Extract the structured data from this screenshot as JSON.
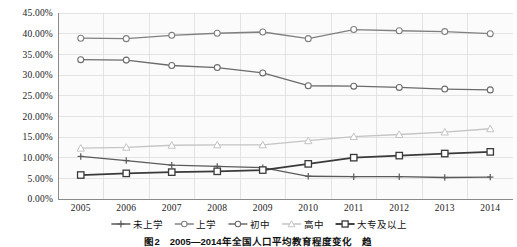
{
  "chart_data": {
    "type": "line",
    "title": "",
    "xlabel": "",
    "ylabel": "",
    "ylim": [
      0,
      45
    ],
    "ytick_values": [
      0,
      5,
      10,
      15,
      20,
      25,
      30,
      35,
      40,
      45
    ],
    "ytick_labels": [
      "0.00%",
      "5.00%",
      "10.00%",
      "15.00%",
      "20.00%",
      "25.00%",
      "30.00%",
      "35.00%",
      "40.00%",
      "45.00%"
    ],
    "grid": true,
    "legend_position": "bottom",
    "categories": [
      "2005",
      "2006",
      "2007",
      "2008",
      "2009",
      "2010",
      "2011",
      "2012",
      "2013",
      "2014"
    ],
    "series": [
      {
        "name": "未上学",
        "marker": "plus",
        "color": "#5a5a5a",
        "values": [
          10.3,
          9.3,
          8.2,
          7.9,
          7.6,
          5.5,
          5.4,
          5.4,
          5.2,
          5.3
        ]
      },
      {
        "name": "上学",
        "marker": "circle",
        "color": "#808080",
        "values": [
          38.9,
          38.8,
          39.6,
          40.1,
          40.4,
          38.8,
          41.0,
          40.7,
          40.5,
          40.0
        ]
      },
      {
        "name": "初中",
        "marker": "circle",
        "color": "#6b6b6b",
        "values": [
          33.7,
          33.6,
          32.3,
          31.8,
          30.5,
          27.4,
          27.3,
          27.0,
          26.6,
          26.4
        ]
      },
      {
        "name": "高中",
        "marker": "triangle",
        "color": "#c4c4c4",
        "values": [
          12.3,
          12.5,
          13.0,
          13.1,
          13.1,
          14.1,
          15.1,
          15.6,
          16.2,
          17.0
        ]
      },
      {
        "name": "大专及以上",
        "marker": "square",
        "color": "#3a3a3a",
        "values": [
          5.8,
          6.2,
          6.5,
          6.7,
          7.0,
          8.5,
          10.0,
          10.5,
          11.0,
          11.4
        ]
      }
    ],
    "caption": "图2　2005—2014年全国人口平均教育程度变化　趋"
  }
}
